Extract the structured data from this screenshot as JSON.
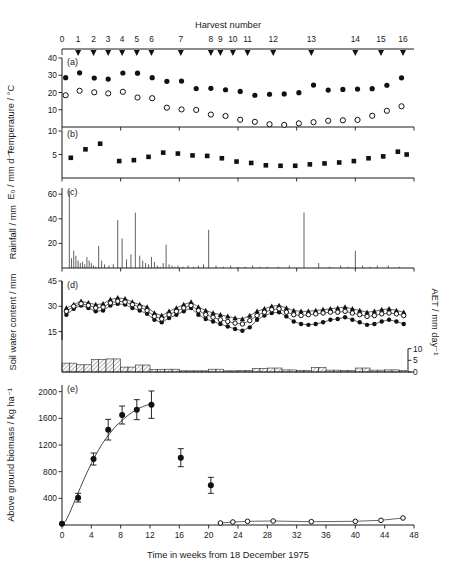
{
  "figure": {
    "top_axis_title": "Harvest number",
    "x_axis_title": "Time in weeks from 18 December 1975",
    "harvest_numbers": [
      "0",
      "1",
      "2",
      "3",
      "4",
      "5",
      "6",
      "7",
      "8",
      "9",
      "10",
      "11",
      "12",
      "13",
      "14",
      "15",
      "16"
    ],
    "harvest_weeks": [
      0,
      2.2,
      4.3,
      6.3,
      8.2,
      10.2,
      12.2,
      16.2,
      20.3,
      21.6,
      23.3,
      25.3,
      28.8,
      34.0,
      40.0,
      43.5,
      46.5
    ],
    "panel_letters": [
      "(a)",
      "(b)",
      "(c)",
      "(d)",
      "(e)"
    ]
  },
  "chart_data": [
    {
      "type": "scatter",
      "panel": "(a)",
      "title": "",
      "ylabel": "Temperature / °C",
      "xlabel": "Time in weeks from 18 December 1975",
      "ylim": [
        0,
        40
      ],
      "yticks": [
        10,
        20,
        30,
        40
      ],
      "xlim": [
        0,
        48
      ],
      "grid": false,
      "series": [
        {
          "name": "maximum temperature",
          "marker": "filled-circle",
          "x": [
            0.5,
            2.4,
            4.4,
            6.3,
            8.3,
            10.3,
            12.3,
            14.3,
            16.3,
            18.3,
            20.3,
            22.3,
            24.3,
            26.3,
            28.3,
            30.3,
            32.3,
            34.3,
            36.3,
            38.3,
            40.3,
            42.3,
            44.3,
            46.3
          ],
          "values": [
            28.6,
            31.4,
            28.4,
            27.8,
            31.3,
            31.2,
            28.6,
            26.5,
            26.6,
            22.3,
            22.4,
            21.6,
            20.6,
            18.4,
            19.0,
            19.2,
            19.9,
            24.3,
            21.4,
            21.8,
            22.0,
            22.2,
            24.2,
            28.5
          ]
        },
        {
          "name": "minimum temperature",
          "marker": "open-circle",
          "x": [
            0.5,
            2.4,
            4.4,
            6.3,
            8.3,
            10.3,
            12.3,
            14.3,
            16.3,
            18.3,
            20.3,
            22.3,
            24.3,
            26.3,
            28.3,
            30.3,
            32.3,
            34.3,
            36.3,
            38.3,
            40.3,
            42.3,
            44.3,
            46.3
          ],
          "values": [
            18.4,
            21.0,
            20.1,
            19.5,
            20.4,
            17.1,
            16.7,
            11.2,
            10.2,
            9.9,
            7.2,
            6.4,
            4.2,
            3.0,
            1.6,
            1.2,
            2.1,
            2.8,
            3.6,
            3.9,
            4.1,
            6.5,
            9.4,
            12.0
          ]
        }
      ]
    },
    {
      "type": "scatter",
      "panel": "(b)",
      "ylabel": "E₀ / mm d⁻¹",
      "ylim": [
        0,
        10
      ],
      "yticks": [
        5,
        10
      ],
      "xlim": [
        0,
        48
      ],
      "grid": false,
      "series": [
        {
          "name": "open pan evaporation",
          "marker": "filled-square",
          "x": [
            1.2,
            3.2,
            5.2,
            7.8,
            9.8,
            11.8,
            13.8,
            15.8,
            17.8,
            19.8,
            21.8,
            23.8,
            25.8,
            27.8,
            29.8,
            31.8,
            33.8,
            35.8,
            37.8,
            39.8,
            41.8,
            43.8,
            45.8,
            47.0
          ],
          "values": [
            4.3,
            6.1,
            7.3,
            3.6,
            3.8,
            4.5,
            5.4,
            5.2,
            4.8,
            4.7,
            4.2,
            3.5,
            3.2,
            2.7,
            2.6,
            2.6,
            2.9,
            3.1,
            3.3,
            3.6,
            4.2,
            4.6,
            5.6,
            5.0
          ]
        }
      ]
    },
    {
      "type": "bar",
      "panel": "(c)",
      "ylabel": "Rainfall / mm",
      "ylim": [
        0,
        65
      ],
      "yticks": [
        20,
        40,
        60
      ],
      "xlim": [
        0,
        48
      ],
      "grid": false,
      "bar_x": [
        1.0,
        1.3,
        1.6,
        1.9,
        2.2,
        2.5,
        2.8,
        3.1,
        3.4,
        3.7,
        4.0,
        4.3,
        4.6,
        5.0,
        5.4,
        5.8,
        6.4,
        7.0,
        7.6,
        8.2,
        8.8,
        9.4,
        10.0,
        10.6,
        11.0,
        11.4,
        11.8,
        12.2,
        12.6,
        13.0,
        13.4,
        13.8,
        14.2,
        14.6,
        15.0,
        15.4,
        15.8,
        16.5,
        17.2,
        17.9,
        18.6,
        19.3,
        20.0,
        21.0,
        22.0,
        23.0,
        24.0,
        25.0,
        26.0,
        27.0,
        28.0,
        29.5,
        31.0,
        33.0,
        35.0,
        36.5,
        38.0,
        39.0,
        40.0,
        41.0,
        42.0,
        43.0,
        44.5,
        46.0
      ],
      "values": [
        63,
        8,
        14,
        10,
        6,
        4,
        5,
        3,
        9,
        6,
        4,
        2,
        1,
        18,
        6,
        3,
        2,
        3,
        39,
        24,
        7,
        11,
        45,
        10,
        6,
        4,
        3,
        9,
        5,
        2,
        1,
        4,
        19,
        3,
        2,
        1,
        2,
        1,
        2,
        1,
        2,
        3,
        31,
        2,
        1,
        2,
        1,
        1,
        2,
        1,
        1,
        1,
        2,
        45,
        4,
        1,
        2,
        1,
        14,
        2,
        1,
        2,
        2,
        1
      ]
    },
    {
      "type": "line",
      "panel": "(d)",
      "ylabel": "Soil water content / mm",
      "ylabel_right": "AET / mm day⁻¹",
      "ylim": [
        10,
        45
      ],
      "yticks": [
        15,
        30,
        45
      ],
      "yticks_right": [
        0,
        5,
        10
      ],
      "xlim": [
        0,
        48
      ],
      "grid": false,
      "series": [
        {
          "name": "treatment-1-filled-circle",
          "marker": "filled-circle",
          "x": [
            0.6,
            1.6,
            2.6,
            3.6,
            4.6,
            5.6,
            6.6,
            7.6,
            8.6,
            9.6,
            10.6,
            11.6,
            12.6,
            13.6,
            14.6,
            15.6,
            16.6,
            17.6,
            18.6,
            19.6,
            20.6,
            21.6,
            22.6,
            23.6,
            24.6,
            25.6,
            26.6,
            27.6,
            28.6,
            29.6,
            30.6,
            31.6,
            32.6,
            33.6,
            34.6,
            35.6,
            36.6,
            37.6,
            38.6,
            39.6,
            40.6,
            41.6,
            42.6,
            43.6,
            44.6,
            45.6,
            46.6
          ],
          "values": [
            25.0,
            28.5,
            30.5,
            29.0,
            27.0,
            27.5,
            30.5,
            31.5,
            31.0,
            29.0,
            27.5,
            25.5,
            22.0,
            20.5,
            23.0,
            25.0,
            27.0,
            29.0,
            25.0,
            22.5,
            21.0,
            19.5,
            18.0,
            16.5,
            15.5,
            17.5,
            22.0,
            24.5,
            26.0,
            26.5,
            24.0,
            21.0,
            19.5,
            19.0,
            19.5,
            20.5,
            22.0,
            22.5,
            23.5,
            22.0,
            20.5,
            19.0,
            19.5,
            21.0,
            22.0,
            21.0,
            19.5
          ]
        },
        {
          "name": "treatment-2-filled-triangle",
          "marker": "filled-triangle",
          "x": [
            0.6,
            1.6,
            2.6,
            3.6,
            4.6,
            5.6,
            6.6,
            7.6,
            8.6,
            9.6,
            10.6,
            11.6,
            12.6,
            13.6,
            14.6,
            15.6,
            16.6,
            17.6,
            18.6,
            19.6,
            20.6,
            21.6,
            22.6,
            23.6,
            24.6,
            25.6,
            26.6,
            27.6,
            28.6,
            29.6,
            30.6,
            31.6,
            32.6,
            33.6,
            34.6,
            35.6,
            36.6,
            37.6,
            38.6,
            39.6,
            40.6,
            41.6,
            42.6,
            43.6,
            44.6,
            45.6,
            46.6
          ],
          "values": [
            29.0,
            31.0,
            33.0,
            32.0,
            31.0,
            31.5,
            34.0,
            35.0,
            34.5,
            32.5,
            31.0,
            29.5,
            26.0,
            24.5,
            27.0,
            29.0,
            31.0,
            32.5,
            29.5,
            27.5,
            26.0,
            25.0,
            24.0,
            23.0,
            22.5,
            24.5,
            27.0,
            28.5,
            30.0,
            30.5,
            29.0,
            27.5,
            27.0,
            27.0,
            27.5,
            28.0,
            28.5,
            29.0,
            29.5,
            28.5,
            27.5,
            26.5,
            27.0,
            28.0,
            28.5,
            27.5,
            26.5
          ]
        },
        {
          "name": "treatment-3-open-circle",
          "marker": "open-circle",
          "x": [
            0.6,
            1.6,
            2.6,
            3.6,
            4.6,
            5.6,
            6.6,
            7.6,
            8.6,
            9.6,
            10.6,
            11.6,
            12.6,
            13.6,
            14.6,
            15.6,
            16.6,
            17.6,
            18.6,
            19.6,
            20.6,
            21.6,
            22.6,
            23.6,
            24.6,
            25.6,
            26.6,
            27.6,
            28.6,
            29.6,
            30.6,
            31.6,
            32.6,
            33.6,
            34.6,
            35.6,
            36.6,
            37.6,
            38.6,
            39.6,
            40.6,
            41.6,
            42.6,
            43.6,
            44.6,
            45.6,
            46.6
          ],
          "values": [
            27.0,
            30.0,
            31.5,
            30.5,
            29.0,
            29.5,
            32.0,
            33.0,
            32.5,
            31.0,
            29.5,
            27.5,
            24.0,
            22.5,
            25.0,
            27.0,
            29.0,
            30.5,
            27.5,
            25.0,
            23.5,
            22.0,
            21.0,
            20.0,
            19.5,
            21.5,
            24.5,
            26.5,
            28.0,
            28.5,
            26.5,
            25.0,
            24.5,
            25.0,
            25.5,
            26.0,
            26.5,
            26.5,
            27.0,
            26.0,
            25.0,
            24.0,
            24.5,
            25.5,
            26.0,
            25.5,
            24.5
          ]
        }
      ],
      "aet_bars": {
        "name": "actual evapotranspiration",
        "x": [
          0.5,
          1.5,
          2.5,
          3.5,
          4.5,
          5.5,
          6.5,
          7.5,
          8.5,
          9.5,
          10.5,
          11.5,
          12.5,
          13.5,
          14.5,
          15.5,
          16.5,
          17.5,
          18.5,
          19.5,
          20.5,
          21.5,
          22.5,
          23.5,
          24.5,
          25.5,
          26.5,
          27.5,
          28.5,
          29.5,
          30.5,
          31.5,
          32.5,
          33.5,
          34.5,
          35.5,
          36.5,
          37.5,
          38.5,
          39.5,
          40.5,
          41.5,
          42.5,
          43.5,
          44.5,
          45.5,
          46.5
        ],
        "values": [
          3.8,
          3.8,
          3.1,
          3.1,
          5.3,
          5.3,
          5.6,
          5.6,
          2.1,
          2.1,
          3.0,
          3.0,
          1.0,
          1.0,
          1.2,
          1.2,
          0.5,
          0.5,
          0.5,
          0.5,
          1.2,
          1.2,
          0.5,
          0.5,
          0.6,
          0.6,
          1.5,
          1.5,
          1.7,
          1.7,
          0.9,
          0.9,
          0.6,
          0.6,
          1.9,
          1.9,
          0.8,
          0.8,
          0.7,
          0.7,
          1.7,
          1.7,
          0.8,
          0.8,
          0.9,
          0.9,
          0.6
        ]
      }
    },
    {
      "type": "scatter",
      "panel": "(e)",
      "ylabel": "Above ground biomass / kg ha⁻¹",
      "xlabel": "Time in weeks from 18 December 1975",
      "ylim": [
        0,
        2100
      ],
      "yticks": [
        400,
        800,
        1200,
        1600,
        2000
      ],
      "xlim": [
        0,
        48
      ],
      "xticks": [
        0,
        4,
        8,
        12,
        16,
        20,
        24,
        28,
        32,
        36,
        40,
        44,
        48
      ],
      "grid": false,
      "series": [
        {
          "name": "above-ground-biomass-harvested",
          "marker": "filled-circle-errorbar",
          "x": [
            0.0,
            2.2,
            4.3,
            6.3,
            8.2,
            10.2,
            12.2,
            16.2,
            20.3
          ],
          "values": [
            20,
            410,
            990,
            1430,
            1650,
            1730,
            1805,
            1010,
            595
          ],
          "errors": [
            10,
            65,
            90,
            155,
            135,
            150,
            205,
            135,
            120
          ]
        },
        {
          "name": "residual-biomass",
          "marker": "open-circle",
          "x": [
            21.6,
            23.3,
            25.3,
            28.8,
            34.0,
            40.0,
            43.5,
            46.5
          ],
          "values": [
            30,
            45,
            55,
            60,
            50,
            55,
            70,
            105
          ],
          "errors": [
            0,
            0,
            0,
            0,
            0,
            0,
            0,
            0
          ]
        }
      ],
      "fit_curve": {
        "name": "fitted-growth-curve",
        "x": [
          0.0,
          0.5,
          1.0,
          1.5,
          2.0,
          2.5,
          3.0,
          3.5,
          4.0,
          4.5,
          5.0,
          5.5,
          6.0,
          6.5,
          7.0,
          7.5,
          8.0,
          8.5,
          9.0,
          9.5,
          10.0,
          10.5,
          11.0,
          11.5,
          12.0,
          12.3
        ],
        "values": [
          10,
          60,
          170,
          300,
          430,
          560,
          690,
          810,
          920,
          1030,
          1130,
          1220,
          1300,
          1370,
          1440,
          1500,
          1550,
          1600,
          1645,
          1685,
          1720,
          1750,
          1775,
          1795,
          1810,
          1815
        ]
      }
    }
  ]
}
